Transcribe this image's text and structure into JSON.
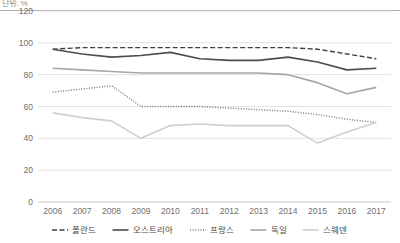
{
  "axis_unit_label": "단위: %",
  "chart_data": {
    "type": "line",
    "title": "",
    "subtitle": "",
    "xlabel": "",
    "ylabel": "",
    "unit": "단위: %",
    "grid": true,
    "legend_position": "bottom",
    "ylim": [
      0,
      120
    ],
    "yticks": [
      0,
      20,
      40,
      60,
      80,
      100,
      120
    ],
    "ytick_labels": [
      "0",
      "20",
      "40",
      "60",
      "80",
      "100",
      "120"
    ],
    "categories": [
      "2006",
      "2007",
      "2008",
      "2009",
      "2010",
      "2011",
      "2012",
      "2013",
      "2014",
      "2015",
      "2016",
      "2017"
    ],
    "series": [
      {
        "name": "폴란드",
        "style": "dashed",
        "color": "#404040",
        "values": [
          96,
          97,
          97,
          97,
          97,
          97,
          97,
          97,
          97,
          96,
          93,
          90
        ]
      },
      {
        "name": "오스트리아",
        "style": "solid",
        "color": "#4d4d4d",
        "values": [
          96,
          93,
          91,
          92,
          94,
          90,
          89,
          89,
          91,
          88,
          83,
          84
        ]
      },
      {
        "name": "프랑스",
        "style": "dotted",
        "color": "#7a7a7a",
        "values": [
          69,
          71,
          73,
          60,
          60,
          60,
          59,
          58,
          57,
          55,
          52,
          50
        ]
      },
      {
        "name": "독일",
        "style": "solid",
        "color": "#a6a6a6",
        "values": [
          84,
          83,
          82,
          81,
          81,
          81,
          81,
          81,
          80,
          75,
          68,
          72
        ]
      },
      {
        "name": "스웨덴",
        "style": "solid",
        "color": "#cfcfcf",
        "values": [
          56,
          53,
          51,
          40,
          48,
          49,
          48,
          48,
          48,
          37,
          44,
          50
        ]
      }
    ]
  },
  "legend": {
    "items": [
      {
        "label": "폴란드",
        "style": "dashed",
        "color": "#404040"
      },
      {
        "label": "오스트리아",
        "style": "solid",
        "color": "#4d4d4d"
      },
      {
        "label": "프랑스",
        "style": "dotted",
        "color": "#7a7a7a"
      },
      {
        "label": "독일",
        "style": "solid",
        "color": "#a6a6a6"
      },
      {
        "label": "스웨덴",
        "style": "solid",
        "color": "#cfcfcf"
      }
    ]
  }
}
